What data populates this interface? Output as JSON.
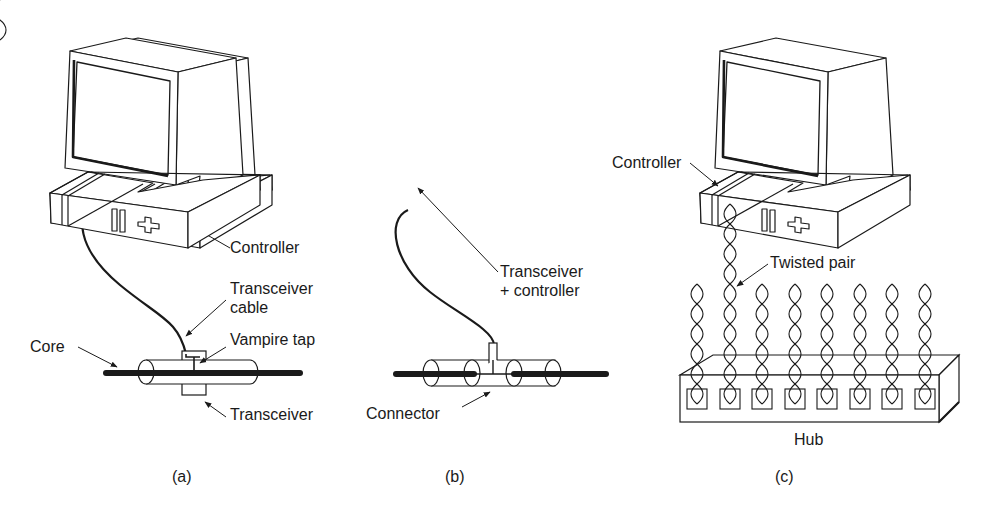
{
  "panels": [
    {
      "id": "a",
      "caption": "(a)",
      "labels": {
        "controller": "Controller",
        "transceiver_cable_line1": "Transceiver",
        "transceiver_cable_line2": "cable",
        "vampire_tap": "Vampire tap",
        "core": "Core",
        "transceiver": "Transceiver"
      }
    },
    {
      "id": "b",
      "caption": "(b)",
      "labels": {
        "transceiver_controller_line1": "Transceiver",
        "transceiver_controller_line2": "+ controller",
        "connector": "Connector"
      }
    },
    {
      "id": "c",
      "caption": "(c)",
      "labels": {
        "controller": "Controller",
        "twisted_pair": "Twisted pair",
        "hub": "Hub"
      },
      "hub_port_count": 8
    }
  ],
  "colors": {
    "line": "#1a1a1a",
    "background": "#ffffff"
  }
}
